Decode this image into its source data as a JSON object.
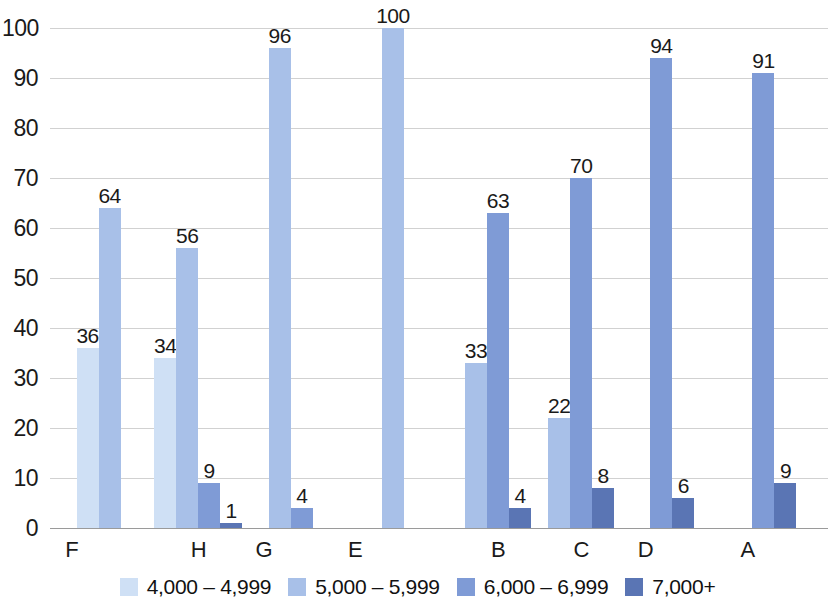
{
  "chart_data": {
    "type": "bar",
    "title": "",
    "subtitle": "",
    "xlabel": "",
    "ylabel": "",
    "ylim": [
      0,
      100
    ],
    "ytick_step": 10,
    "yticks": [
      "100",
      "90",
      "80",
      "70",
      "60",
      "50",
      "40",
      "30",
      "20",
      "10",
      "0"
    ],
    "grid": true,
    "grouped": true,
    "legend_position": "bottom",
    "categories": [
      "F",
      "H",
      "G",
      "E",
      "B",
      "C",
      "D",
      "A"
    ],
    "series": [
      {
        "name": "4,000 – 4,999",
        "color": "#cfe0f5",
        "values": [
          36,
          34,
          null,
          null,
          null,
          null,
          null,
          null
        ]
      },
      {
        "name": "5,000 – 5,999",
        "color": "#a8c0e8",
        "values": [
          64,
          56,
          96,
          100,
          33,
          22,
          null,
          null
        ]
      },
      {
        "name": "6,000 – 6,999",
        "color": "#7f9bd6",
        "values": [
          null,
          9,
          4,
          null,
          63,
          70,
          94,
          91
        ]
      },
      {
        "name": "7,000+",
        "color": "#5a75b4",
        "values": [
          null,
          1,
          null,
          null,
          4,
          8,
          6,
          9
        ]
      }
    ],
    "point_labels": {
      "F": [
        "36",
        "64"
      ],
      "H": [
        "34",
        "56",
        "9",
        "1"
      ],
      "G": [
        "96",
        "4"
      ],
      "E": [
        "100"
      ],
      "B": [
        "33",
        "63",
        "4"
      ],
      "C": [
        "22",
        "70",
        "8"
      ],
      "D": [
        "94",
        "6"
      ],
      "A": [
        "91",
        "9"
      ]
    }
  },
  "legend": {
    "items": [
      {
        "label": "4,000 – 4,999",
        "color": "#cfe0f5"
      },
      {
        "label": "5,000 – 5,999",
        "color": "#a8c0e8"
      },
      {
        "label": "6,000 – 6,999",
        "color": "#7f9bd6"
      },
      {
        "label": "7,000+",
        "color": "#5a75b4"
      }
    ]
  }
}
